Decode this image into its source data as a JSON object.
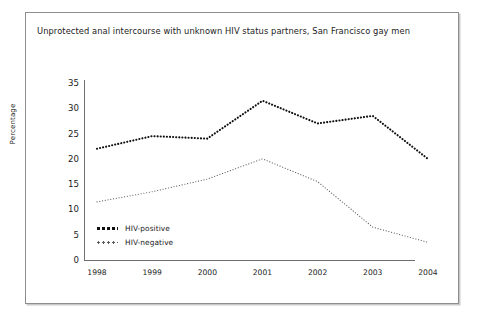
{
  "chart_data": {
    "type": "line",
    "title": "Unprotected anal intercourse with unknown HIV status partners, San Francisco gay men",
    "xlabel": "",
    "ylabel": "Percentage",
    "categories": [
      "1998",
      "1999",
      "2000",
      "2001",
      "2002",
      "2003",
      "2004"
    ],
    "ylim": [
      0,
      35
    ],
    "yticks": [
      "0",
      "5",
      "10",
      "15",
      "20",
      "25",
      "30",
      "35"
    ],
    "ytick_values": [
      0,
      5,
      10,
      15,
      20,
      25,
      30,
      35
    ],
    "grid": false,
    "legend_position": "inside-lower-left",
    "series": [
      {
        "name": "HIV-positive",
        "style": "thick-dotted",
        "color": "#101010",
        "values": [
          22,
          24.5,
          24,
          31.5,
          27,
          28.5,
          20
        ]
      },
      {
        "name": "HIV-negative",
        "style": "thin-dotted",
        "color": "#5c5c5c",
        "values": [
          11.5,
          13.5,
          16,
          20,
          15.5,
          6.5,
          3.5
        ]
      }
    ]
  },
  "figure": {
    "border_color": "#8e8e8e",
    "background": "#ffffff"
  }
}
